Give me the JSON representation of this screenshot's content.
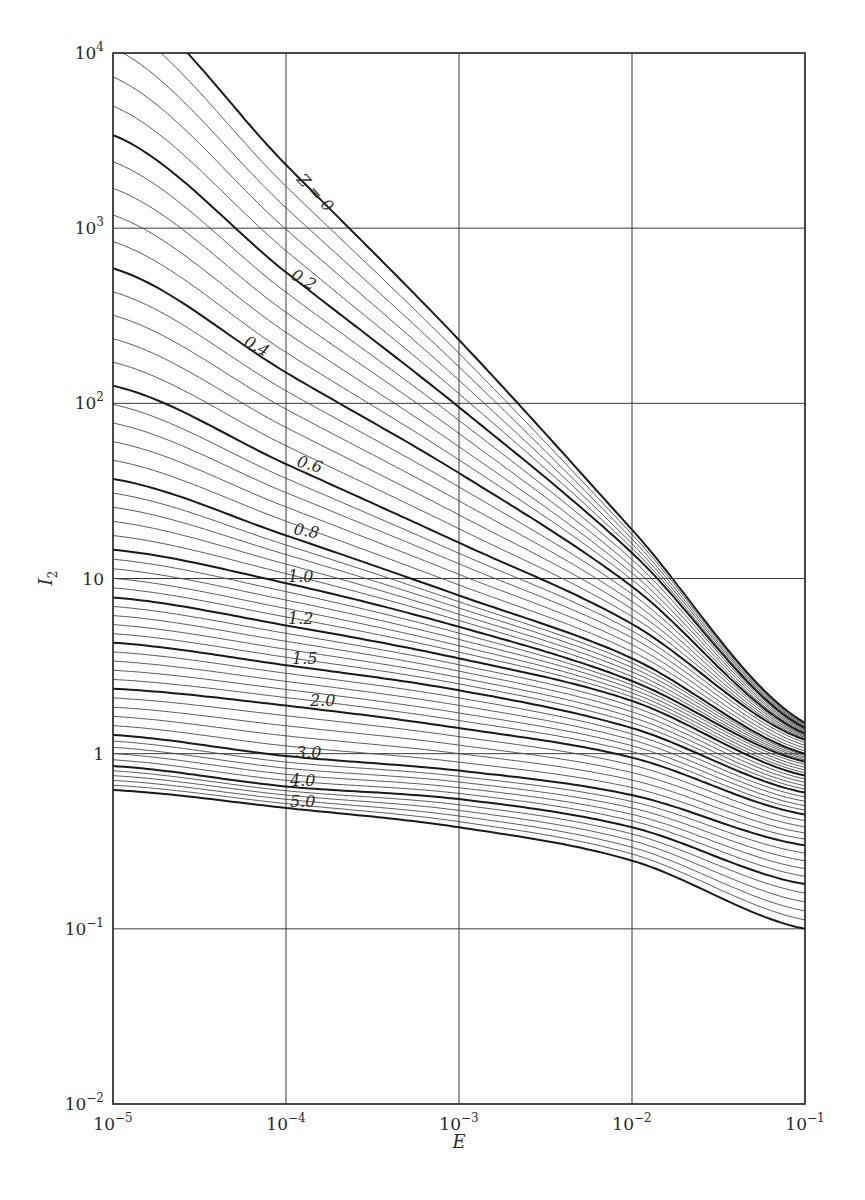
{
  "chart_data": {
    "type": "line",
    "title": "",
    "xlabel": "E",
    "ylabel": "I2",
    "x_scale": "log",
    "y_scale": "log",
    "xlim": [
      1e-05,
      0.1
    ],
    "ylim": [
      0.01,
      10000.0
    ],
    "grid": true,
    "legend": "none (inline curve labels)",
    "x_ticks": [
      {
        "base": "10",
        "exp": "−5",
        "value": 1e-05
      },
      {
        "base": "10",
        "exp": "−4",
        "value": 0.0001
      },
      {
        "base": "10",
        "exp": "−3",
        "value": 0.001
      },
      {
        "base": "10",
        "exp": "−2",
        "value": 0.01
      },
      {
        "base": "10",
        "exp": "−1",
        "value": 0.1
      }
    ],
    "y_ticks": [
      {
        "base": "10",
        "exp": "4",
        "value": 10000.0
      },
      {
        "base": "10",
        "exp": "3",
        "value": 1000.0
      },
      {
        "base": "10",
        "exp": "2",
        "value": 100.0
      },
      {
        "base": "10",
        "exp": "",
        "value": 10
      },
      {
        "base": "1",
        "exp": "",
        "value": 1
      },
      {
        "base": "10",
        "exp": "−1",
        "value": 0.1
      },
      {
        "base": "10",
        "exp": "−2",
        "value": 0.01
      }
    ],
    "x": [
      1e-05,
      0.0001,
      0.001,
      0.01,
      0.1
    ],
    "series": [
      {
        "name": "Z=0",
        "label": "Z = 0",
        "values": [
          23000,
          2300,
          230,
          19,
          1.5
        ]
      },
      {
        "name": "Z=0.2",
        "label": "0.2",
        "values": [
          3400,
          560,
          95,
          14,
          1.4
        ]
      },
      {
        "name": "Z=0.4",
        "label": "0.4",
        "values": [
          590,
          150,
          40,
          9,
          1.3
        ]
      },
      {
        "name": "Z=0.6",
        "label": "0.6",
        "values": [
          126,
          45,
          16,
          5.5,
          1.2
        ]
      },
      {
        "name": "Z=0.8",
        "label": "0.8",
        "values": [
          37,
          17.6,
          8,
          3.5,
          1.0
        ]
      },
      {
        "name": "Z=1.0",
        "label": "1.0",
        "values": [
          14.6,
          9.4,
          5.3,
          2.6,
          0.9
        ]
      },
      {
        "name": "Z=1.2",
        "label": "1.2",
        "values": [
          7.8,
          5.4,
          3.5,
          2.0,
          0.75
        ]
      },
      {
        "name": "Z=1.5",
        "label": "1.5",
        "values": [
          4.3,
          3.2,
          2.3,
          1.4,
          0.6
        ]
      },
      {
        "name": "Z=2.0",
        "label": "2.0",
        "values": [
          2.35,
          1.88,
          1.4,
          0.95,
          0.45
        ]
      },
      {
        "name": "Z=3.0",
        "label": "3.0",
        "values": [
          1.28,
          0.97,
          0.8,
          0.58,
          0.3
        ]
      },
      {
        "name": "Z=4.0",
        "label": "4.0",
        "values": [
          0.85,
          0.65,
          0.55,
          0.38,
          0.18
        ]
      },
      {
        "name": "Z=5.0",
        "label": "5.0",
        "values": [
          0.62,
          0.49,
          0.38,
          0.245,
          0.1
        ]
      }
    ],
    "curve_labels": [
      {
        "text": "Z = 0",
        "x": 296,
        "y": 180,
        "angle": 47
      },
      {
        "text": "0.2",
        "x": 290,
        "y": 278,
        "angle": 30
      },
      {
        "text": "0.4",
        "x": 243,
        "y": 345,
        "angle": 28
      },
      {
        "text": "0.6",
        "x": 296,
        "y": 466,
        "angle": 16
      },
      {
        "text": "0.8",
        "x": 293,
        "y": 534,
        "angle": 10
      },
      {
        "text": "1.0",
        "x": 288,
        "y": 582,
        "angle": 0
      },
      {
        "text": "1.2",
        "x": 288,
        "y": 624,
        "angle": 0
      },
      {
        "text": "1.5",
        "x": 292,
        "y": 664,
        "angle": 0
      },
      {
        "text": "2.0",
        "x": 310,
        "y": 706,
        "angle": 0
      },
      {
        "text": "3.0",
        "x": 296,
        "y": 758,
        "angle": 0
      },
      {
        "text": "4.0",
        "x": 290,
        "y": 786,
        "angle": 0
      },
      {
        "text": "5.0",
        "x": 290,
        "y": 807,
        "angle": 0
      }
    ],
    "thin_curves_between_labeled": 4,
    "colors": {
      "line": "#1a1a1a",
      "thin_line": "#4a4a4a",
      "grid": "#3a3a3a",
      "background": "#ffffff"
    }
  }
}
